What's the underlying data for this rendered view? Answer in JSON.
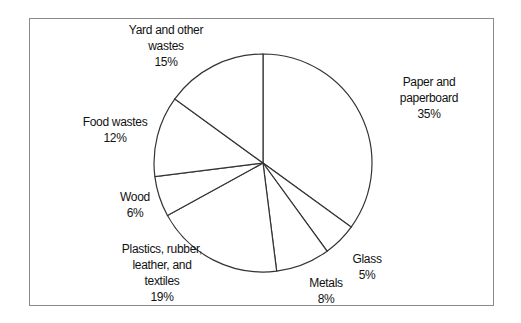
{
  "chart_data": {
    "type": "pie",
    "title": "",
    "categories": [
      "Paper and paperboard",
      "Glass",
      "Metals",
      "Plastics, rubber, leather, and textiles",
      "Wood",
      "Food wastes",
      "Yard and other wastes"
    ],
    "values": [
      35,
      5,
      8,
      19,
      6,
      12,
      15
    ],
    "unit": "%",
    "start_angle": "12 o'clock, clockwise",
    "legend": "none (labels outside slices)",
    "fill": "#ffffff",
    "stroke": "#333333"
  },
  "labels": {
    "paper": {
      "line1": "Paper and",
      "line2": "paperboard",
      "pct": "35%"
    },
    "glass": {
      "line1": "Glass",
      "pct": "5%"
    },
    "metals": {
      "line1": "Metals",
      "pct": "8%"
    },
    "plastics": {
      "line1": "Plastics, rubber,",
      "line2": "leather, and",
      "line3": "textiles",
      "pct": "19%"
    },
    "wood": {
      "line1": "Wood",
      "pct": "6%"
    },
    "food": {
      "line1": "Food wastes",
      "pct": "12%"
    },
    "yard": {
      "line1": "Yard and other",
      "line2": "wastes",
      "pct": "15%"
    }
  }
}
